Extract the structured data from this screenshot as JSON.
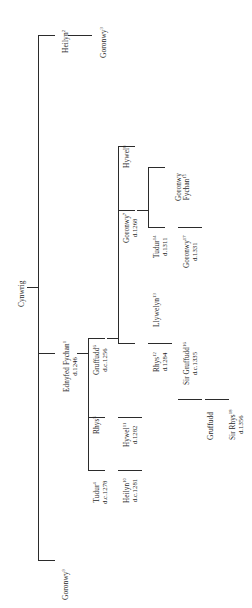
{
  "figure": {
    "type": "genealogical-family-tree",
    "orientation": "rotated-90-ccw",
    "root": "Cynwrig",
    "line_color": "#2b2b2b",
    "background_color": "#ffffff"
  },
  "nodes": {
    "cynwrig": {
      "name": "Cynwrig",
      "sup": "",
      "date": ""
    },
    "heilyn_top": {
      "name": "Heilyn",
      "sup": "2",
      "date": ""
    },
    "goronwy_top": {
      "name": "Goronwy",
      "sup": "3",
      "date": ""
    },
    "ednyfed": {
      "name": "Ednyfed Fychan",
      "sup": "1",
      "date": "d.1246"
    },
    "goronwy_bottom": {
      "name": "Goronwy",
      "sup": "9",
      "date": ""
    },
    "tudur4": {
      "name": "Tudur",
      "sup": "4",
      "date": "d.c.1278"
    },
    "rhys5": {
      "name": "Rhys",
      "sup": "5",
      "date": ""
    },
    "gruffudd6": {
      "name": "Gruffudd",
      "sup": "6",
      "date": "d.c.1256"
    },
    "goronwy7": {
      "name": "Goronwy",
      "sup": "7",
      "date": "d.1268"
    },
    "hywel8": {
      "name": "Hywel",
      "sup": "8",
      "date": ""
    },
    "heilyn10": {
      "name": "Heilyn",
      "sup": "10",
      "date": "d.c.1281"
    },
    "hywel11": {
      "name": "Hywel",
      "sup": "11",
      "date": "d.1282"
    },
    "rhys12": {
      "name": "Rhys",
      "sup": "12",
      "date": "d.1284"
    },
    "llywelyn13": {
      "name": "Llywelyn",
      "sup": "13",
      "date": ""
    },
    "tudur14": {
      "name": "Tudur",
      "sup": "14",
      "date": "d.1311"
    },
    "goronwy_fychan15": {
      "name": "Goronwy Fychan",
      "sup": "15",
      "date": ""
    },
    "sir_gruffudd16": {
      "name": "Sir Gruffudd",
      "sup": "16",
      "date": "d.c.1335"
    },
    "goronwy17": {
      "name": "Goronwy",
      "sup": "17",
      "date": "d.1331"
    },
    "gruffudd_lower": {
      "name": "Gruffudd",
      "sup": "",
      "date": ""
    },
    "sir_rhys18": {
      "name": "Sir Rhys",
      "sup": "18",
      "date": "d.1356"
    }
  }
}
